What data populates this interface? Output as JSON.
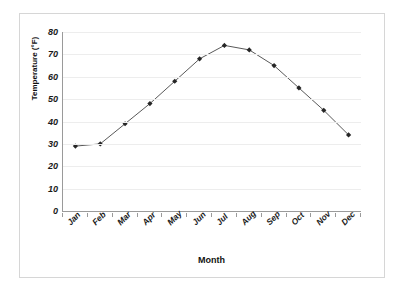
{
  "chart_data": {
    "type": "line",
    "title": "",
    "xlabel": "Month",
    "ylabel": "Temperature (°F)",
    "categories": [
      "Jan",
      "Feb",
      "Mar",
      "Apr",
      "May",
      "Jun",
      "Jul",
      "Aug",
      "Sep",
      "Oct",
      "Nov",
      "Dec"
    ],
    "values": [
      29,
      30,
      39,
      48,
      58,
      68,
      74,
      72,
      65,
      55,
      45,
      34
    ],
    "series": [
      {
        "name": "Temperature",
        "values": [
          29,
          30,
          39,
          48,
          58,
          68,
          74,
          72,
          65,
          55,
          45,
          34
        ]
      }
    ],
    "ylim": [
      0,
      80
    ],
    "ytick_labels": [
      "80",
      "70",
      "60",
      "50",
      "40",
      "30",
      "20",
      "10",
      "0"
    ],
    "ytick_values": [
      80,
      70,
      60,
      50,
      40,
      30,
      20,
      10,
      0
    ],
    "grid": "horizontal",
    "legend": "none",
    "marker": "diamond",
    "line_color": "#595959",
    "marker_color": "#262626",
    "grid_color": "#ededed",
    "axis_color": "#9a9a9a",
    "frame_color": "#d6d6d6",
    "background": "#ffffff"
  }
}
